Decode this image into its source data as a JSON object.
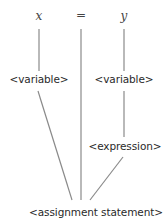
{
  "diagram": {
    "type": "parse-tree",
    "tokens": [
      {
        "id": "tok-x",
        "label": "x",
        "x": 39,
        "y": 16
      },
      {
        "id": "tok-eq",
        "label": "=",
        "x": 81,
        "y": 16
      },
      {
        "id": "tok-y",
        "label": "y",
        "x": 124,
        "y": 16
      }
    ],
    "nodes": [
      {
        "id": "var-left",
        "label": "<variable>",
        "x": 39,
        "y": 79
      },
      {
        "id": "var-right",
        "label": "<variable>",
        "x": 124,
        "y": 79
      },
      {
        "id": "expression",
        "label": "<expression>",
        "x": 124,
        "y": 146
      },
      {
        "id": "assignment",
        "label": "<assignment statement>",
        "x": 96,
        "y": 212
      }
    ],
    "edges": [
      {
        "from": "tok-x",
        "to": "var-left"
      },
      {
        "from": "tok-y",
        "to": "var-right"
      },
      {
        "from": "tok-eq",
        "to": "assignment"
      },
      {
        "from": "var-right",
        "to": "expression"
      },
      {
        "from": "var-left",
        "to": "assignment"
      },
      {
        "from": "expression",
        "to": "assignment"
      }
    ],
    "colors": {
      "line": "#8a8a8a",
      "text": "#2a2a2a",
      "background": "#ffffff"
    }
  }
}
